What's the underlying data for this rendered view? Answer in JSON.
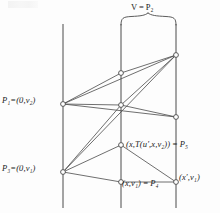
{
  "figure": {
    "background_color": "#fdfdfd",
    "line_color": "#4a4a4a",
    "node_fill": "#ffffff",
    "node_stroke": "#4a4a4a"
  },
  "labels": {
    "p1": "P₁=(0,v₂)",
    "p3": "P₃=(0,v₁)",
    "v_bracket": "V = P₂",
    "p5": "(x,T(u′,x,v₂)) = P₅",
    "p4": "(x,v₁) = P₄",
    "x_prime": "(x′,v₁)"
  },
  "axes": {
    "vertical_lines": [
      {
        "name": "left-axis",
        "x": 63,
        "y_top": 24,
        "y_bottom": 208
      },
      {
        "name": "middle-axis",
        "x": 121,
        "y_top": 24,
        "y_bottom": 208
      },
      {
        "name": "right-axis",
        "x": 176,
        "y_top": 24,
        "y_bottom": 208
      }
    ]
  },
  "nodes": [
    {
      "name": "node-p1",
      "x": 63,
      "y": 104,
      "label_ref": "p1"
    },
    {
      "name": "node-p3",
      "x": 63,
      "y": 172,
      "label_ref": "p3"
    },
    {
      "name": "node-mid-top",
      "x": 121,
      "y": 73,
      "label_ref": ""
    },
    {
      "name": "node-mid-cross",
      "x": 121,
      "y": 105,
      "label_ref": ""
    },
    {
      "name": "node-p5",
      "x": 121,
      "y": 145,
      "label_ref": "p5"
    },
    {
      "name": "node-p4",
      "x": 121,
      "y": 182,
      "label_ref": "p4"
    },
    {
      "name": "node-right-top",
      "x": 176,
      "y": 55,
      "label_ref": ""
    },
    {
      "name": "node-right-mid",
      "x": 176,
      "y": 117,
      "label_ref": ""
    },
    {
      "name": "node-x-prime",
      "x": 176,
      "y": 182,
      "label_ref": "x_prime"
    }
  ],
  "edges": [
    {
      "name": "edge-p1-mid-top",
      "from": "node-p1",
      "to": "node-mid-top"
    },
    {
      "name": "edge-mid-top-right-top",
      "from": "node-mid-top",
      "to": "node-right-top"
    },
    {
      "name": "edge-p1-right-top",
      "from": "node-p1",
      "to": "node-right-top"
    },
    {
      "name": "edge-p1-mid-cross",
      "from": "node-p1",
      "to": "node-mid-cross"
    },
    {
      "name": "edge-mid-cross-right-mid",
      "from": "node-mid-cross",
      "to": "node-right-mid"
    },
    {
      "name": "edge-p1-right-mid",
      "from": "node-p1",
      "to": "node-right-mid"
    },
    {
      "name": "edge-p3-mid-cross",
      "from": "node-p3",
      "to": "node-mid-cross"
    },
    {
      "name": "edge-mid-cross-right-top",
      "from": "node-mid-cross",
      "to": "node-right-top"
    },
    {
      "name": "edge-p3-right-top",
      "from": "node-p3",
      "to": "node-right-top"
    },
    {
      "name": "edge-p3-p5",
      "from": "node-p3",
      "to": "node-p5"
    },
    {
      "name": "edge-p5-x-prime",
      "from": "node-p5",
      "to": "node-x-prime"
    },
    {
      "name": "edge-p3-p4",
      "from": "node-p3",
      "to": "node-p4"
    },
    {
      "name": "edge-p4-x-prime",
      "from": "node-p4",
      "to": "node-x-prime"
    }
  ],
  "bracket": {
    "name": "v-span-bracket",
    "left_x": 121,
    "right_x": 176,
    "y": 24,
    "tip_x": 148,
    "tip_y": 14
  }
}
